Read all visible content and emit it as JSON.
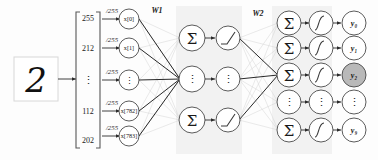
{
  "diagram": {
    "input_image": {
      "name": "handwritten-digit",
      "glyph": "2",
      "label": "2"
    },
    "input_vector": {
      "name": "pixel-vector",
      "bracket_left": "[",
      "bracket_right": "]",
      "values": [
        "255",
        "212",
        "⋮",
        "112",
        "202"
      ]
    },
    "scaling": {
      "label": "/255",
      "labels": [
        "/255",
        "/255",
        "/255",
        "/255",
        "/255"
      ]
    },
    "input_layer": {
      "name": "input-layer",
      "nodes": [
        "x[0]",
        "x[1]",
        "⋮",
        "x[782]",
        "x[783]"
      ]
    },
    "weights": {
      "w1_label": "W1",
      "w2_label": "W2"
    },
    "hidden_layer": {
      "name": "hidden-layer",
      "sum_nodes": [
        "Σ",
        "⋮",
        "Σ"
      ],
      "activation_nodes": [
        "relu",
        "⋮",
        "relu"
      ],
      "activation_name": "relu"
    },
    "output_layer": {
      "name": "output-layer",
      "sum_nodes": [
        "Σ",
        "Σ",
        "Σ",
        "⋮",
        "Σ"
      ],
      "activation_nodes": [
        "sigmoid",
        "sigmoid",
        "sigmoid",
        "⋮",
        "sigmoid"
      ],
      "activation_name": "sigmoid",
      "outputs": [
        {
          "label": "y₀",
          "highlighted": false
        },
        {
          "label": "y₁",
          "highlighted": false
        },
        {
          "label": "y₂",
          "highlighted": true
        },
        {
          "label": "⋮",
          "highlighted": false
        },
        {
          "label": "y₉",
          "highlighted": false
        }
      ]
    },
    "colors": {
      "panel": "#f2f2f2",
      "node_stroke": "#4a4a4a",
      "highlight_fill": "#b9b9b9",
      "edge_faint": "#cfcfcf",
      "edge_strong": "#1d1d1d",
      "text": "#1a1a1a"
    }
  }
}
